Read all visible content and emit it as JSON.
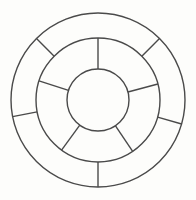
{
  "figure": {
    "name": "concentric-wheel-diagram",
    "title": "Concentric Wheel Diagram",
    "canvas": {
      "width": 196,
      "height": 200
    },
    "background_color": "#fdfdfb",
    "stroke_color": "#4a4a4a",
    "stroke_width": 1.4,
    "fill_color": "none"
  },
  "geometry": {
    "center": {
      "x": 98,
      "y": 100
    },
    "circles": [
      {
        "name": "outer-circle",
        "radius": 87,
        "label": "Outer circle"
      },
      {
        "name": "middle-circle",
        "radius": 62,
        "label": "Middle circle"
      },
      {
        "name": "inner-circle",
        "radius": 31,
        "label": "Inner circle (hub)"
      }
    ]
  },
  "rings": [
    {
      "name": "outer-ring",
      "label": "Outer ring",
      "inner_radius": 62,
      "outer_radius": 87,
      "segment_count": 5,
      "divider_angles_deg": [
        45,
        135,
        191,
        270,
        344
      ],
      "segments": [
        {
          "name": "outer-segment-1",
          "start_deg": 45,
          "end_deg": 135
        },
        {
          "name": "outer-segment-2",
          "start_deg": 135,
          "end_deg": 191
        },
        {
          "name": "outer-segment-3",
          "start_deg": 191,
          "end_deg": 270
        },
        {
          "name": "outer-segment-4",
          "start_deg": 270,
          "end_deg": 344
        },
        {
          "name": "outer-segment-5",
          "start_deg": 344,
          "end_deg": 405
        }
      ]
    },
    {
      "name": "middle-ring",
      "label": "Middle ring",
      "inner_radius": 31,
      "outer_radius": 62,
      "segment_count": 5,
      "divider_angles_deg": [
        15,
        90,
        162,
        234,
        304
      ],
      "segments": [
        {
          "name": "middle-segment-1",
          "start_deg": 15,
          "end_deg": 90
        },
        {
          "name": "middle-segment-2",
          "start_deg": 90,
          "end_deg": 162
        },
        {
          "name": "middle-segment-3",
          "start_deg": 162,
          "end_deg": 234
        },
        {
          "name": "middle-segment-4",
          "start_deg": 234,
          "end_deg": 304
        },
        {
          "name": "middle-segment-5",
          "start_deg": 304,
          "end_deg": 375
        }
      ]
    },
    {
      "name": "inner-hub",
      "label": "Inner hub",
      "inner_radius": 0,
      "outer_radius": 31,
      "segment_count": 1,
      "divider_angles_deg": [],
      "segments": [
        {
          "name": "hub-area",
          "start_deg": 0,
          "end_deg": 360
        }
      ]
    }
  ],
  "annotations": {
    "text_labels": [],
    "legend": null,
    "caption": null
  }
}
